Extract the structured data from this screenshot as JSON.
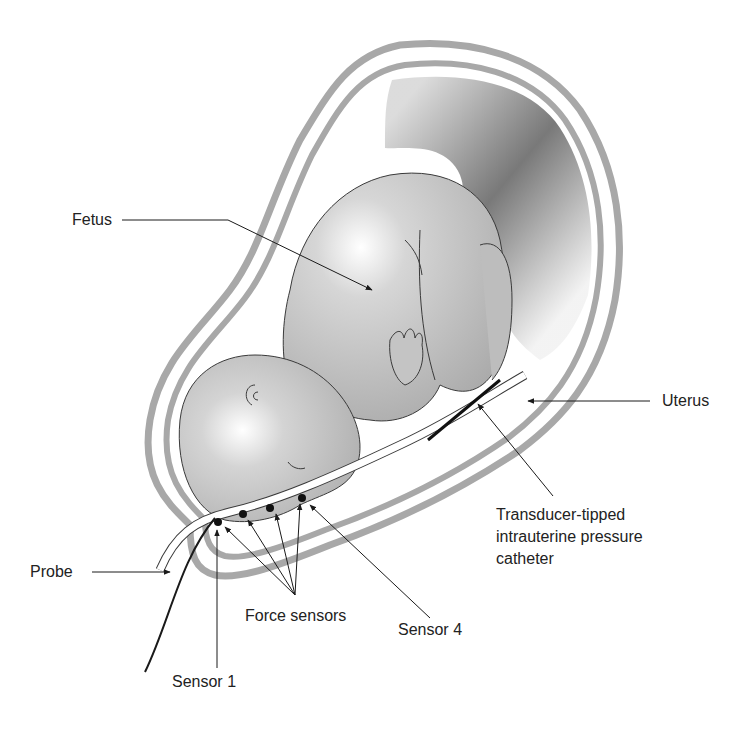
{
  "diagram": {
    "type": "anatomical-illustration",
    "labels": {
      "fetus": "Fetus",
      "uterus": "Uterus",
      "catheter_line1": "Transducer-tipped",
      "catheter_line2": "intrauterine pressure",
      "catheter_line3": "catheter",
      "probe": "Probe",
      "force_sensors": "Force sensors",
      "sensor_1": "Sensor 1",
      "sensor_4": "Sensor 4"
    },
    "colors": {
      "uterus_wall": "#a8a8a8",
      "fetus_fill": "#c8c8c8",
      "fluid_dark": "#6e6e6e",
      "line": "#1a1a1a",
      "background": "#ffffff"
    },
    "sensor_count": 4
  }
}
